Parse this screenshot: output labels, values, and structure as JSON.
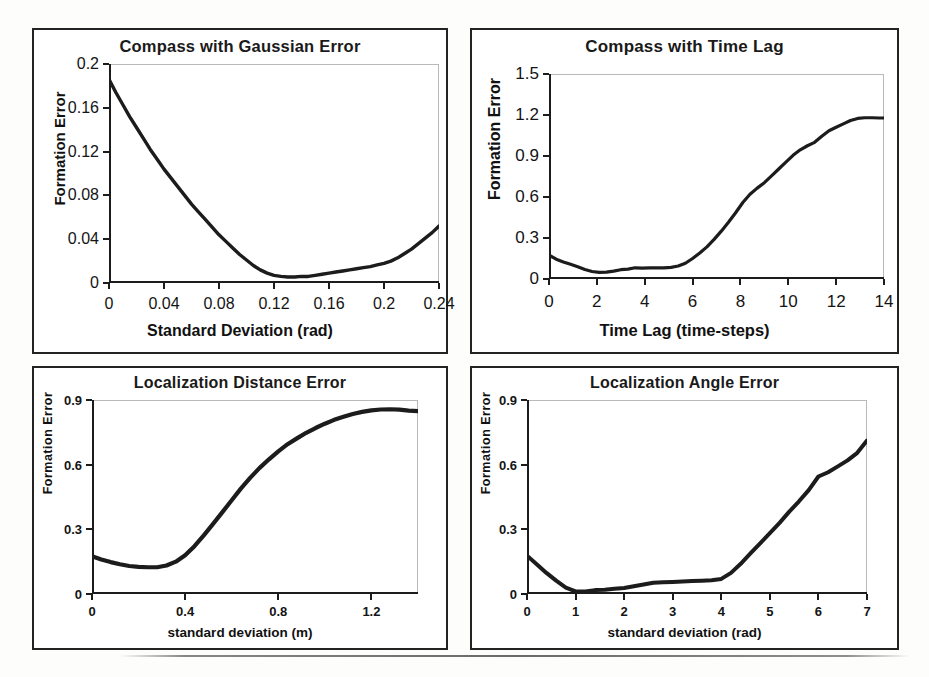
{
  "figure": {
    "panel_count": 4,
    "line_color": "#1c1c1c",
    "frame_color": "#232323"
  },
  "chart_data": [
    {
      "id": "compass-gaussian-error",
      "type": "line",
      "title": "Compass with Gaussian Error",
      "xlabel": "Standard Deviation (rad)",
      "ylabel": "Formation Error",
      "xlim": [
        0,
        0.24
      ],
      "ylim": [
        0,
        0.2
      ],
      "xticks": [
        0,
        0.04,
        0.08,
        0.12,
        0.16,
        0.2,
        0.24
      ],
      "xticklabels": [
        "0",
        "0.04",
        "0.08",
        "0.12",
        "0.16",
        "0.2",
        "0.24"
      ],
      "yticks": [
        0,
        0.04,
        0.08,
        0.12,
        0.16,
        0.2
      ],
      "yticklabels": [
        "0",
        "0.04",
        "0.08",
        "0.12",
        "0.16",
        "0.2"
      ],
      "grid": false,
      "legend": null,
      "x": [
        0,
        0.005,
        0.01,
        0.015,
        0.02,
        0.025,
        0.03,
        0.035,
        0.04,
        0.045,
        0.05,
        0.055,
        0.06,
        0.065,
        0.07,
        0.075,
        0.08,
        0.085,
        0.09,
        0.095,
        0.1,
        0.105,
        0.11,
        0.115,
        0.12,
        0.125,
        0.13,
        0.135,
        0.14,
        0.145,
        0.15,
        0.155,
        0.16,
        0.165,
        0.17,
        0.175,
        0.18,
        0.185,
        0.19,
        0.195,
        0.2,
        0.205,
        0.21,
        0.215,
        0.22,
        0.225,
        0.23,
        0.235,
        0.24
      ],
      "values": [
        0.186,
        0.174,
        0.163,
        0.152,
        0.142,
        0.132,
        0.122,
        0.113,
        0.104,
        0.096,
        0.088,
        0.08,
        0.072,
        0.065,
        0.058,
        0.051,
        0.044,
        0.038,
        0.032,
        0.026,
        0.021,
        0.016,
        0.012,
        0.009,
        0.007,
        0.006,
        0.0055,
        0.0055,
        0.006,
        0.006,
        0.007,
        0.008,
        0.009,
        0.01,
        0.011,
        0.012,
        0.013,
        0.014,
        0.015,
        0.0165,
        0.018,
        0.02,
        0.023,
        0.027,
        0.031,
        0.036,
        0.041,
        0.046,
        0.052
      ]
    },
    {
      "id": "compass-time-lag",
      "type": "line",
      "title": "Compass with Time Lag",
      "xlabel": "Time Lag (time-steps)",
      "ylabel": "Formation Error",
      "xlim": [
        0,
        14
      ],
      "ylim": [
        0,
        1.5
      ],
      "xticks": [
        0,
        2,
        4,
        6,
        8,
        10,
        12,
        14
      ],
      "xticklabels": [
        "0",
        "2",
        "4",
        "6",
        "8",
        "10",
        "12",
        "14"
      ],
      "yticks": [
        0,
        0.3,
        0.6,
        0.9,
        1.2,
        1.5
      ],
      "yticklabels": [
        "0",
        "0.3",
        "0.6",
        "0.9",
        "1.2",
        "1.5"
      ],
      "grid": false,
      "legend": null,
      "x": [
        0,
        0.3,
        0.6,
        0.9,
        1.2,
        1.5,
        1.8,
        2.1,
        2.4,
        2.7,
        3.0,
        3.3,
        3.6,
        3.9,
        4.2,
        4.5,
        4.8,
        5.1,
        5.4,
        5.7,
        6.0,
        6.3,
        6.6,
        6.9,
        7.2,
        7.5,
        7.8,
        8.1,
        8.4,
        8.7,
        9.0,
        9.3,
        9.6,
        9.9,
        10.2,
        10.5,
        10.8,
        11.1,
        11.4,
        11.7,
        12.0,
        12.3,
        12.6,
        12.9,
        13.2,
        13.5,
        13.8,
        14.0
      ],
      "values": [
        0.175,
        0.145,
        0.125,
        0.108,
        0.09,
        0.07,
        0.055,
        0.048,
        0.05,
        0.058,
        0.068,
        0.072,
        0.082,
        0.08,
        0.082,
        0.082,
        0.082,
        0.085,
        0.095,
        0.115,
        0.15,
        0.19,
        0.235,
        0.29,
        0.35,
        0.415,
        0.485,
        0.56,
        0.62,
        0.665,
        0.705,
        0.755,
        0.805,
        0.855,
        0.905,
        0.945,
        0.975,
        1.0,
        1.045,
        1.085,
        1.11,
        1.135,
        1.16,
        1.175,
        1.18,
        1.18,
        1.178,
        1.178
      ]
    },
    {
      "id": "localization-distance-error",
      "type": "line",
      "title": "Localization Distance Error",
      "xlabel": "standard deviation (m)",
      "ylabel": "Formation Error",
      "xlim": [
        0,
        1.4
      ],
      "ylim": [
        0,
        0.9
      ],
      "xticks": [
        0,
        0.4,
        0.8,
        1.2
      ],
      "xticklabels": [
        "0",
        "0.4",
        "0.8",
        "1.2"
      ],
      "yticks": [
        0,
        0.3,
        0.6,
        0.9
      ],
      "yticklabels": [
        "0",
        "0.3",
        "0.6",
        "0.9"
      ],
      "grid": false,
      "legend": null,
      "x": [
        0,
        0.04,
        0.08,
        0.12,
        0.16,
        0.2,
        0.24,
        0.28,
        0.32,
        0.36,
        0.4,
        0.44,
        0.48,
        0.52,
        0.56,
        0.6,
        0.64,
        0.68,
        0.72,
        0.76,
        0.8,
        0.84,
        0.88,
        0.92,
        0.96,
        1.0,
        1.04,
        1.08,
        1.12,
        1.16,
        1.2,
        1.24,
        1.28,
        1.32,
        1.36,
        1.4
      ],
      "values": [
        0.175,
        0.16,
        0.148,
        0.138,
        0.13,
        0.126,
        0.124,
        0.124,
        0.132,
        0.15,
        0.18,
        0.222,
        0.272,
        0.325,
        0.38,
        0.435,
        0.49,
        0.54,
        0.585,
        0.625,
        0.662,
        0.695,
        0.722,
        0.748,
        0.77,
        0.79,
        0.808,
        0.822,
        0.835,
        0.845,
        0.852,
        0.856,
        0.857,
        0.855,
        0.851,
        0.848
      ]
    },
    {
      "id": "localization-angle-error",
      "type": "line",
      "title": "Localization Angle Error",
      "xlabel": "standard deviation (rad)",
      "ylabel": "Formation Error",
      "xlim": [
        0,
        7
      ],
      "ylim": [
        0,
        0.9
      ],
      "xticks": [
        0,
        1,
        2,
        3,
        4,
        5,
        6,
        7
      ],
      "xticklabels": [
        "0",
        "1",
        "2",
        "3",
        "4",
        "5",
        "6",
        "7"
      ],
      "yticks": [
        0,
        0.3,
        0.6,
        0.9
      ],
      "yticklabels": [
        "0",
        "0.3",
        "0.6",
        "0.9"
      ],
      "grid": false,
      "legend": null,
      "x": [
        0,
        0.2,
        0.4,
        0.6,
        0.8,
        1.0,
        1.2,
        1.4,
        1.6,
        1.8,
        2.0,
        2.2,
        2.4,
        2.6,
        2.8,
        3.0,
        3.2,
        3.4,
        3.6,
        3.8,
        4.0,
        4.2,
        4.4,
        4.6,
        4.8,
        5.0,
        5.2,
        5.4,
        5.6,
        5.8,
        6.0,
        6.2,
        6.4,
        6.6,
        6.8,
        7.0
      ],
      "values": [
        0.178,
        0.138,
        0.098,
        0.062,
        0.03,
        0.012,
        0.012,
        0.018,
        0.02,
        0.024,
        0.028,
        0.036,
        0.044,
        0.052,
        0.054,
        0.056,
        0.058,
        0.06,
        0.062,
        0.064,
        0.07,
        0.098,
        0.14,
        0.188,
        0.235,
        0.282,
        0.33,
        0.382,
        0.43,
        0.482,
        0.545,
        0.565,
        0.592,
        0.62,
        0.655,
        0.712
      ]
    }
  ]
}
